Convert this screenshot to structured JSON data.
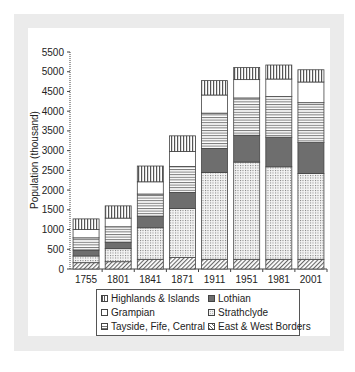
{
  "chart_data": {
    "type": "bar",
    "stacked": true,
    "title": "",
    "xlabel": "",
    "ylabel": "Population (thousand)",
    "ylim": [
      0,
      5500
    ],
    "yticks": [
      0,
      500,
      1000,
      1500,
      2000,
      2500,
      3000,
      3500,
      4000,
      4500,
      5000,
      5500
    ],
    "grid": false,
    "legend_position": "bottom",
    "categories": [
      "1755",
      "1801",
      "1841",
      "1871",
      "1911",
      "1951",
      "1981",
      "2001"
    ],
    "series": [
      {
        "name": "East & West Borders",
        "pattern": "diagonal-hatch",
        "values": [
          160,
          185,
          245,
          290,
          245,
          245,
          245,
          245
        ]
      },
      {
        "name": "Strathclyde",
        "pattern": "dots",
        "values": [
          170,
          330,
          800,
          1245,
          2200,
          2465,
          2345,
          2175
        ]
      },
      {
        "name": "Lothian",
        "pattern": "solid-dark",
        "values": [
          150,
          165,
          295,
          405,
          610,
          680,
          750,
          785
        ]
      },
      {
        "name": "Tayside, Fife, Central",
        "pattern": "horizontal-lines",
        "values": [
          310,
          390,
          560,
          660,
          895,
          945,
          1030,
          1010
        ]
      },
      {
        "name": "Grampian",
        "pattern": "white",
        "values": [
          210,
          220,
          310,
          380,
          460,
          465,
          445,
          525
        ]
      },
      {
        "name": "Highlands & Islands",
        "pattern": "vertical-lines",
        "values": [
          270,
          310,
          400,
          395,
          365,
          305,
          355,
          310
        ]
      }
    ],
    "totals": [
      1270,
      1600,
      2610,
      3375,
      4775,
      5105,
      5170,
      5050
    ]
  },
  "legend": {
    "items": [
      {
        "label": "Highlands & Islands",
        "pattern": "vertical-lines"
      },
      {
        "label": "Lothian",
        "pattern": "solid-dark"
      },
      {
        "label": "Grampian",
        "pattern": "white"
      },
      {
        "label": "Strathclyde",
        "pattern": "dots"
      },
      {
        "label": "Tayside, Fife, Central",
        "pattern": "horizontal-lines"
      },
      {
        "label": "East & West Borders",
        "pattern": "diagonal-hatch"
      }
    ]
  },
  "colors": {
    "frame": "#ebebeb",
    "lothian": "#6e6e6e",
    "outline": "#444444"
  }
}
